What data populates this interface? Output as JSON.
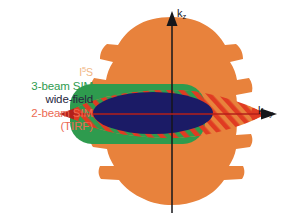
{
  "figure": {
    "name": "otf-support-comparison",
    "background": "#ffffff"
  },
  "axes": {
    "vertical": {
      "label_main": "k",
      "label_sub": "z",
      "color": "#16161a",
      "x": 172,
      "y_top": 14,
      "y_bottom": 213
    },
    "horizontal": {
      "label_main": "k",
      "label_sub": "x,y",
      "color": "#16161a",
      "y": 114,
      "x_left": 62,
      "x_right": 272
    }
  },
  "legend": {
    "items": [
      {
        "label": "I",
        "sup": "5",
        "label_tail": "S",
        "color": "#f0b684",
        "name": "legend-i5s"
      },
      {
        "label": "3-beam SIM",
        "color": "#2e9b4e",
        "name": "legend-3-beam-sim"
      },
      {
        "label": "wide-field",
        "color": "#262640",
        "name": "legend-wide-field"
      },
      {
        "label": "2-beam SIM",
        "color": "#ec6a52",
        "name": "legend-2-beam-sim"
      },
      {
        "label": "(TIRF)",
        "color": "#ec6a52",
        "name": "legend-tirf"
      }
    ]
  },
  "regions": {
    "i5s": {
      "name": "i5s-region",
      "color": "#e8823c",
      "description": "outer lobed orange OTF support"
    },
    "three_beam_sim": {
      "name": "3-beam-sim-region",
      "color": "#2e9b4e",
      "description": "green rounded rectangle"
    },
    "two_beam_sim": {
      "name": "2-beam-sim-region",
      "color": "#e03b22",
      "hatch": "diagonal",
      "description": "red hatched lens"
    },
    "wide_field": {
      "name": "wide-field-region",
      "color": "#1b1b66",
      "description": "dark navy ellipse"
    }
  },
  "colors": {
    "orange": "#e8823c",
    "orange_light": "#f0b684",
    "green": "#2e9b4e",
    "red": "#e03b22",
    "red_text": "#ec6a52",
    "navy": "#1b1b66",
    "navy_text": "#262640",
    "axis": "#16161a",
    "background": "#ffffff"
  }
}
